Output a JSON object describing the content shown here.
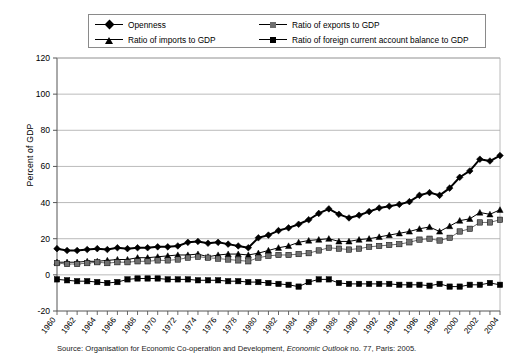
{
  "legend": {
    "entries": [
      {
        "label": "Openness",
        "marker": "diamond",
        "color": "#000000"
      },
      {
        "label": "Ratio of imports to GDP",
        "marker": "triangle",
        "color": "#000000"
      },
      {
        "label": "Ratio of  exports to GDP",
        "marker": "square-gray",
        "color": "#6f6f6f"
      },
      {
        "label": "Ratio of foreign current account balance to GDP",
        "marker": "square",
        "color": "#000000"
      }
    ]
  },
  "axis": {
    "y_title": "Percent of GDP",
    "y_ticks": [
      "-20",
      "0",
      "20",
      "40",
      "60",
      "80",
      "100",
      "120"
    ],
    "x_ticks": [
      "1960",
      "1962",
      "1964",
      "1966",
      "1968",
      "1970",
      "1972",
      "1974",
      "1976",
      "1978",
      "1980",
      "1982",
      "1984",
      "1986",
      "1988",
      "1990",
      "1992",
      "1994",
      "1996",
      "1998",
      "2000",
      "2002",
      "2004"
    ]
  },
  "source": {
    "prefix": "Source: Organisation for Economic Co-operation and Development, ",
    "italic": "Economic Outlook",
    "suffix": " no. 77, Paris: 2005."
  },
  "chart_data": {
    "type": "line",
    "title": "",
    "xlabel": "",
    "ylabel": "Percent of GDP",
    "ylim": [
      -20,
      120
    ],
    "xlim": [
      1960,
      2004
    ],
    "grid": true,
    "legend_position": "top",
    "x": [
      1960,
      1961,
      1962,
      1963,
      1964,
      1965,
      1966,
      1967,
      1968,
      1969,
      1970,
      1971,
      1972,
      1973,
      1974,
      1975,
      1976,
      1977,
      1978,
      1979,
      1980,
      1981,
      1982,
      1983,
      1984,
      1985,
      1986,
      1987,
      1988,
      1989,
      1990,
      1991,
      1992,
      1993,
      1994,
      1995,
      1996,
      1997,
      1998,
      1999,
      2000,
      2001,
      2002,
      2003,
      2004
    ],
    "series": [
      {
        "name": "Openness",
        "marker": "diamond",
        "color": "#000000",
        "values": [
          14.5,
          13.5,
          13.5,
          14.0,
          14.5,
          14.0,
          15.0,
          14.5,
          15.0,
          15.0,
          15.5,
          15.5,
          16.0,
          18.0,
          18.5,
          17.5,
          18.0,
          17.0,
          16.0,
          15.0,
          20.5,
          22.0,
          24.5,
          26.0,
          28.0,
          30.5,
          34.0,
          36.5,
          33.5,
          31.5,
          33.0,
          35.0,
          37.0,
          38.0,
          39.0,
          40.5,
          44.0,
          45.5,
          44.0,
          48.0,
          54.0,
          57.5,
          64.0,
          63.0,
          66.0
        ]
      },
      {
        "name": "Ratio of imports to GDP",
        "marker": "triangle",
        "color": "#000000",
        "values": [
          7.0,
          7.0,
          7.0,
          7.5,
          7.5,
          8.0,
          8.5,
          8.5,
          9.5,
          9.5,
          10.0,
          10.5,
          11.0,
          11.0,
          11.5,
          10.0,
          11.0,
          11.5,
          11.5,
          11.0,
          12.0,
          13.5,
          15.0,
          16.0,
          18.0,
          19.0,
          19.5,
          20.0,
          18.5,
          18.5,
          19.5,
          20.0,
          21.0,
          22.0,
          23.0,
          24.0,
          25.5,
          26.5,
          24.0,
          27.0,
          30.0,
          31.0,
          34.5,
          33.5,
          36.0
        ]
      },
      {
        "name": "Ratio of  exports to GDP",
        "marker": "square-gray",
        "color": "#6f6f6f",
        "values": [
          6.5,
          6.0,
          6.0,
          6.5,
          7.0,
          6.5,
          7.0,
          7.0,
          7.5,
          7.5,
          8.0,
          8.0,
          8.5,
          9.5,
          10.0,
          9.5,
          9.0,
          8.5,
          8.0,
          7.5,
          9.5,
          10.5,
          11.0,
          11.0,
          11.5,
          12.0,
          13.5,
          15.0,
          14.5,
          14.0,
          14.5,
          15.5,
          16.0,
          16.5,
          17.0,
          18.0,
          19.5,
          20.0,
          19.0,
          20.5,
          24.0,
          25.5,
          29.0,
          29.0,
          30.5
        ]
      },
      {
        "name": "Ratio of foreign current account balance to GDP",
        "marker": "square",
        "color": "#000000",
        "values": [
          -2.5,
          -3.0,
          -3.5,
          -3.5,
          -4.0,
          -4.5,
          -4.0,
          -2.5,
          -2.0,
          -2.0,
          -2.0,
          -2.5,
          -2.5,
          -2.5,
          -3.0,
          -3.0,
          -3.0,
          -3.5,
          -3.5,
          -4.0,
          -4.0,
          -4.5,
          -5.0,
          -5.5,
          -6.5,
          -4.0,
          -2.5,
          -2.5,
          -4.5,
          -5.0,
          -5.0,
          -5.0,
          -5.0,
          -5.0,
          -5.5,
          -5.5,
          -5.5,
          -6.0,
          -5.0,
          -6.5,
          -6.5,
          -5.5,
          -5.5,
          -4.5,
          -5.5
        ]
      }
    ]
  }
}
